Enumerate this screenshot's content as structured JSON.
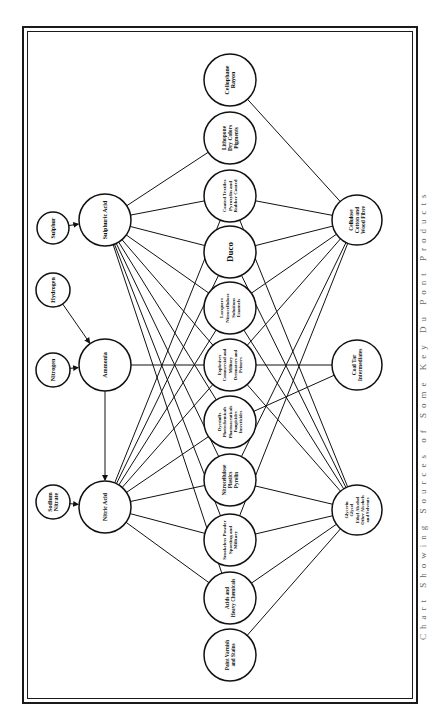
{
  "diagram": {
    "caption": "Chart Showing Sources of Some Key Du Pont Products",
    "colors": {
      "ink": "#111111",
      "paper": "#ffffff",
      "caption": "#666666"
    },
    "nodes": [
      {
        "id": "sulphur",
        "lines": [
          "Sulphur"
        ],
        "x": 53,
        "y": 228,
        "r": 16,
        "fs": 6
      },
      {
        "id": "sulphuric_acid",
        "lines": [
          "Sulphuric Acid"
        ],
        "x": 105,
        "y": 220,
        "r": 26,
        "fs": 6
      },
      {
        "id": "hydrogen",
        "lines": [
          "Hydrogen"
        ],
        "x": 53,
        "y": 290,
        "r": 17,
        "fs": 6
      },
      {
        "id": "nitrogen",
        "lines": [
          "Nitrogen"
        ],
        "x": 53,
        "y": 370,
        "r": 17,
        "fs": 6
      },
      {
        "id": "ammonia",
        "lines": [
          "Ammonia"
        ],
        "x": 105,
        "y": 365,
        "r": 26,
        "fs": 6
      },
      {
        "id": "sodium_nitrate",
        "lines": [
          "Sodium",
          "Nitrate"
        ],
        "x": 53,
        "y": 502,
        "r": 17,
        "fs": 6
      },
      {
        "id": "nitric_acid",
        "lines": [
          "Nitric Acid"
        ],
        "x": 105,
        "y": 507,
        "r": 26,
        "fs": 6
      },
      {
        "id": "cellophane",
        "lines": [
          "Cellophane",
          "Rayon"
        ],
        "x": 230,
        "y": 80,
        "r": 26,
        "fs": 6
      },
      {
        "id": "lithopone",
        "lines": [
          "Lithopone",
          "Dry Colors",
          "Pigments"
        ],
        "x": 230,
        "y": 138,
        "r": 26,
        "fs": 5.5
      },
      {
        "id": "coated_textiles",
        "lines": [
          "Coated Textiles",
          "Pyroxylin and",
          "Rubber Coated"
        ],
        "x": 230,
        "y": 196,
        "r": 26,
        "fs": 5
      },
      {
        "id": "duco",
        "lines": [
          "Duco"
        ],
        "x": 230,
        "y": 252,
        "r": 26,
        "fs": 9
      },
      {
        "id": "lacquers",
        "lines": [
          "Lacquers",
          "Nitrocellulose",
          "Solutions",
          "Enamels"
        ],
        "x": 230,
        "y": 308,
        "r": 26,
        "fs": 5
      },
      {
        "id": "explosives",
        "lines": [
          "Explosives",
          "Commercial and",
          "Military",
          "Detonators and",
          "Primers"
        ],
        "x": 230,
        "y": 365,
        "r": 26,
        "fs": 4.6
      },
      {
        "id": "dyestuffs",
        "lines": [
          "Dyestuffs",
          "Photochemicals",
          "Pharmaceuticals",
          "Fungicides",
          "Insecticides"
        ],
        "x": 230,
        "y": 422,
        "r": 26,
        "fs": 4.6
      },
      {
        "id": "nitrocellulose",
        "lines": [
          "Nitrocellulose",
          "Plastics",
          "Pyrolin"
        ],
        "x": 230,
        "y": 480,
        "r": 26,
        "fs": 5.2
      },
      {
        "id": "smokeless",
        "lines": [
          "Smokeless Powder",
          "Sporting and",
          "Military"
        ],
        "x": 230,
        "y": 540,
        "r": 26,
        "fs": 5
      },
      {
        "id": "acids_heavy",
        "lines": [
          "Acids and",
          "Heavy Chemicals"
        ],
        "x": 230,
        "y": 598,
        "r": 26,
        "fs": 5.2
      },
      {
        "id": "paint",
        "lines": [
          "Paint Varnish",
          "and Stains"
        ],
        "x": 230,
        "y": 655,
        "r": 26,
        "fs": 5.2
      },
      {
        "id": "cellulose",
        "lines": [
          "Cellulose",
          "Cotton and",
          "Wood Fibre"
        ],
        "x": 357,
        "y": 220,
        "r": 25,
        "fs": 5.5
      },
      {
        "id": "coal_tar",
        "lines": [
          "Coal Tar",
          "Intermediates"
        ],
        "x": 357,
        "y": 365,
        "r": 25,
        "fs": 5.5
      },
      {
        "id": "glycerin",
        "lines": [
          "Glycerin",
          "Glycol",
          "Ethyl Alcohol",
          "Other Alcohols",
          "and Solvents"
        ],
        "x": 357,
        "y": 510,
        "r": 25,
        "fs": 4.6
      }
    ],
    "arrows": [
      [
        "sulphur",
        "sulphuric_acid"
      ],
      [
        "hydrogen",
        "ammonia"
      ],
      [
        "nitrogen",
        "ammonia"
      ],
      [
        "ammonia",
        "nitric_acid"
      ],
      [
        "sodium_nitrate",
        "nitric_acid"
      ]
    ],
    "edges": [
      [
        "sulphuric_acid",
        "lithopone"
      ],
      [
        "sulphuric_acid",
        "coated_textiles"
      ],
      [
        "sulphuric_acid",
        "duco"
      ],
      [
        "sulphuric_acid",
        "lacquers"
      ],
      [
        "sulphuric_acid",
        "explosives"
      ],
      [
        "sulphuric_acid",
        "dyestuffs"
      ],
      [
        "sulphuric_acid",
        "nitrocellulose"
      ],
      [
        "sulphuric_acid",
        "smokeless"
      ],
      [
        "sulphuric_acid",
        "acids_heavy"
      ],
      [
        "ammonia",
        "explosives"
      ],
      [
        "nitric_acid",
        "coated_textiles"
      ],
      [
        "nitric_acid",
        "duco"
      ],
      [
        "nitric_acid",
        "lacquers"
      ],
      [
        "nitric_acid",
        "explosives"
      ],
      [
        "nitric_acid",
        "dyestuffs"
      ],
      [
        "nitric_acid",
        "nitrocellulose"
      ],
      [
        "nitric_acid",
        "smokeless"
      ],
      [
        "nitric_acid",
        "acids_heavy"
      ],
      [
        "cellulose",
        "cellophane"
      ],
      [
        "cellulose",
        "coated_textiles"
      ],
      [
        "cellulose",
        "duco"
      ],
      [
        "cellulose",
        "lacquers"
      ],
      [
        "cellulose",
        "explosives"
      ],
      [
        "cellulose",
        "nitrocellulose"
      ],
      [
        "cellulose",
        "smokeless"
      ],
      [
        "coal_tar",
        "explosives"
      ],
      [
        "coal_tar",
        "dyestuffs"
      ],
      [
        "glycerin",
        "coated_textiles"
      ],
      [
        "glycerin",
        "duco"
      ],
      [
        "glycerin",
        "lacquers"
      ],
      [
        "glycerin",
        "explosives"
      ],
      [
        "glycerin",
        "nitrocellulose"
      ],
      [
        "glycerin",
        "smokeless"
      ],
      [
        "glycerin",
        "acids_heavy"
      ],
      [
        "glycerin",
        "paint"
      ]
    ]
  }
}
